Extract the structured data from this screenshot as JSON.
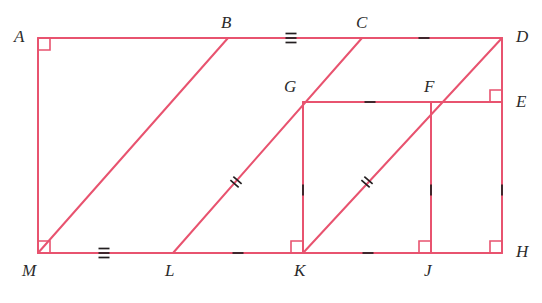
{
  "figure": {
    "stroke_color": "#e8536f",
    "stroke_width": 2,
    "label_color": "#2b2b2b",
    "background": "#ffffff",
    "width": 542,
    "height": 303
  },
  "points": {
    "A": {
      "label": "A",
      "x": 38,
      "y": 38,
      "lx": 14,
      "ly": 28
    },
    "B": {
      "label": "B",
      "x": 228,
      "y": 38,
      "lx": 221,
      "ly": 14
    },
    "C": {
      "label": "C",
      "x": 362,
      "y": 38,
      "lx": 356,
      "ly": 14
    },
    "D": {
      "label": "D",
      "x": 502,
      "y": 38,
      "lx": 516,
      "ly": 28
    },
    "E": {
      "label": "E",
      "x": 502,
      "y": 102,
      "lx": 516,
      "ly": 93
    },
    "F": {
      "label": "F",
      "x": 435,
      "y": 102,
      "lx": 424,
      "ly": 78
    },
    "G": {
      "label": "G",
      "x": 303,
      "y": 102,
      "lx": 284,
      "ly": 78
    },
    "H": {
      "label": "H",
      "x": 502,
      "y": 253,
      "lx": 516,
      "ly": 243
    },
    "J": {
      "label": "J",
      "x": 431,
      "y": 253,
      "lx": 424,
      "ly": 262
    },
    "K": {
      "label": "K",
      "x": 303,
      "y": 253,
      "lx": 294,
      "ly": 262
    },
    "L": {
      "label": "L",
      "x": 173,
      "y": 253,
      "lx": 165,
      "ly": 262
    },
    "M": {
      "label": "M",
      "x": 38,
      "y": 253,
      "lx": 22,
      "ly": 262
    }
  },
  "segments": [
    {
      "name": "top-side-AD",
      "x1": 38,
      "y1": 38,
      "x2": 502,
      "y2": 38
    },
    {
      "name": "left-side-AM",
      "x1": 38,
      "y1": 38,
      "x2": 38,
      "y2": 253
    },
    {
      "name": "bottom-side-MH",
      "x1": 38,
      "y1": 253,
      "x2": 502,
      "y2": 253
    },
    {
      "name": "right-side-DH",
      "x1": 502,
      "y1": 38,
      "x2": 502,
      "y2": 253
    },
    {
      "name": "diagonal-MB",
      "x1": 38,
      "y1": 253,
      "x2": 228,
      "y2": 38
    },
    {
      "name": "diagonal-LC",
      "x1": 173,
      "y1": 253,
      "x2": 362,
      "y2": 38
    },
    {
      "name": "diagonal-KD",
      "x1": 303,
      "y1": 253,
      "x2": 502,
      "y2": 38
    },
    {
      "name": "horizontal-GE",
      "x1": 303,
      "y1": 102,
      "x2": 502,
      "y2": 102
    },
    {
      "name": "vertical-GK",
      "x1": 303,
      "y1": 102,
      "x2": 303,
      "y2": 253
    },
    {
      "name": "vertical-FJ",
      "x1": 431,
      "y1": 102,
      "x2": 431,
      "y2": 253
    }
  ],
  "right_angles": [
    {
      "name": "right-angle-A",
      "x": 38,
      "y": 38,
      "dx": 1,
      "dy": 1,
      "size": 12
    },
    {
      "name": "right-angle-M",
      "x": 38,
      "y": 253,
      "dx": 1,
      "dy": -1,
      "size": 12
    },
    {
      "name": "right-angle-E",
      "x": 502,
      "y": 102,
      "dx": -1,
      "dy": -1,
      "size": 12
    },
    {
      "name": "right-angle-H",
      "x": 502,
      "y": 253,
      "dx": -1,
      "dy": -1,
      "size": 12
    },
    {
      "name": "right-angle-K",
      "x": 303,
      "y": 253,
      "dx": -1,
      "dy": -1,
      "size": 12
    },
    {
      "name": "right-angle-J",
      "x": 431,
      "y": 253,
      "dx": -1,
      "dy": -1,
      "size": 12
    }
  ],
  "tick_marks": [
    {
      "name": "tick-BC-triple",
      "segment": "BC",
      "x": 291,
      "y": 38,
      "angle": 90,
      "count": 3
    },
    {
      "name": "tick-CD-single",
      "segment": "CD",
      "x": 424,
      "y": 38,
      "angle": 90,
      "count": 1
    },
    {
      "name": "tick-ML-triple",
      "segment": "ML",
      "x": 104,
      "y": 253,
      "angle": 90,
      "count": 3
    },
    {
      "name": "tick-LK-single",
      "segment": "LK",
      "x": 238,
      "y": 253,
      "angle": 90,
      "count": 1
    },
    {
      "name": "tick-KJ-single",
      "segment": "KJ",
      "x": 368,
      "y": 253,
      "angle": 90,
      "count": 1
    },
    {
      "name": "tick-GF-single",
      "segment": "GF",
      "x": 370,
      "y": 102,
      "angle": 90,
      "count": 1
    },
    {
      "name": "tick-GK-single",
      "segment": "GK",
      "x": 303,
      "y": 190,
      "angle": 0,
      "count": 1
    },
    {
      "name": "tick-FJ-single",
      "segment": "FJ",
      "x": 431,
      "y": 190,
      "angle": 0,
      "count": 1
    },
    {
      "name": "tick-EH-single",
      "segment": "EH",
      "x": 502,
      "y": 190,
      "angle": 0,
      "count": 1
    },
    {
      "name": "tick-LC-double",
      "segment": "LC",
      "x": 236,
      "y": 182,
      "angle": 131,
      "count": 2
    },
    {
      "name": "tick-KF-double",
      "segment": "KF",
      "x": 367,
      "y": 182,
      "angle": 131,
      "count": 2
    }
  ]
}
